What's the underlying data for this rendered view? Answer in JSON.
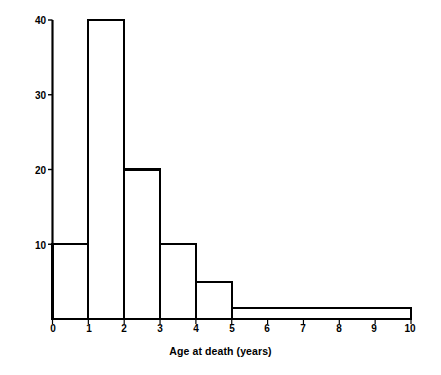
{
  "chart_data": {
    "type": "bar",
    "title": "",
    "subtitle": "",
    "xlabel": "Age at death (years)",
    "ylabel": "Frequency density (number per year of age)",
    "xlim": [
      0,
      10
    ],
    "ylim": [
      0,
      40
    ],
    "grid": false,
    "legend": null,
    "annotations": [],
    "xticks": [
      {
        "value": 0,
        "label": "0"
      },
      {
        "value": 1,
        "label": "1"
      },
      {
        "value": 2,
        "label": "2"
      },
      {
        "value": 3,
        "label": "3"
      },
      {
        "value": 4,
        "label": "4"
      },
      {
        "value": 5,
        "label": "5"
      },
      {
        "value": 6,
        "label": "6"
      },
      {
        "value": 7,
        "label": "7"
      },
      {
        "value": 8,
        "label": "8"
      },
      {
        "value": 9,
        "label": "9"
      },
      {
        "value": 10,
        "label": "10"
      }
    ],
    "yticks": [
      {
        "value": 0,
        "label": ""
      },
      {
        "value": 10,
        "label": "10"
      },
      {
        "value": 20,
        "label": "20"
      },
      {
        "value": 30,
        "label": "30"
      },
      {
        "value": 40,
        "label": "40"
      }
    ],
    "bins": [
      {
        "x0": 0,
        "x1": 1,
        "label": "0-1",
        "value": 10
      },
      {
        "x0": 1,
        "x1": 2,
        "label": "1-2",
        "value": 40
      },
      {
        "x0": 2,
        "x1": 3,
        "label": "2-3",
        "value": 20
      },
      {
        "x0": 3,
        "x1": 4,
        "label": "3-4",
        "value": 10
      },
      {
        "x0": 4,
        "x1": 5,
        "label": "4-5",
        "value": 5
      },
      {
        "x0": 5,
        "x1": 10,
        "label": "5-10",
        "value": 1.5
      }
    ],
    "categories": [
      "0-1",
      "1-2",
      "2-3",
      "3-4",
      "4-5",
      "5-10"
    ],
    "values": [
      10,
      40,
      20,
      10,
      5,
      1.5
    ],
    "colors": {
      "bar_stroke": "#000000",
      "bar_fill": "#ffffff",
      "axis": "#000000",
      "background": "#ffffff",
      "text": "#000000"
    }
  }
}
